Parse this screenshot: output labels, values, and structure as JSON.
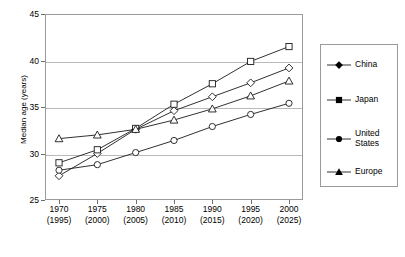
{
  "chart_data": {
    "type": "line",
    "title": "",
    "xlabel": "",
    "ylabel": "Median age (years)",
    "ylim": [
      25,
      45
    ],
    "yticks": [
      25,
      30,
      35,
      40,
      45
    ],
    "grid": true,
    "legend_position": "right",
    "categories": [
      "1970",
      "1975",
      "1980",
      "1985",
      "1990",
      "1995",
      "2000"
    ],
    "categories_secondary": [
      "(1995)",
      "(2000)",
      "(2005)",
      "(2010)",
      "(2015)",
      "(2020)",
      "(2025)"
    ],
    "series": [
      {
        "name": "China",
        "marker": "diamond",
        "values": [
          27.6,
          30.0,
          32.6,
          34.6,
          36.1,
          37.6,
          39.2
        ]
      },
      {
        "name": "Japan",
        "marker": "square",
        "values": [
          29.0,
          30.4,
          32.7,
          35.3,
          37.5,
          39.9,
          41.5
        ]
      },
      {
        "name": "United States",
        "marker": "circle",
        "values": [
          28.2,
          28.8,
          30.1,
          31.4,
          32.9,
          34.2,
          35.4
        ]
      },
      {
        "name": "Europe",
        "marker": "triangle",
        "values": [
          31.6,
          32.0,
          32.6,
          33.6,
          34.8,
          36.2,
          37.8
        ]
      }
    ]
  },
  "legend": {
    "entries": [
      {
        "label": "China"
      },
      {
        "label": "Japan"
      },
      {
        "label": "United States"
      },
      {
        "label": "Europe"
      }
    ]
  },
  "colors": {
    "line": "#1a1a1a",
    "grid": "#b9b9b9",
    "frame": "#9a9a9a",
    "marker_fill": "#ffffff",
    "background": "#ffffff"
  }
}
